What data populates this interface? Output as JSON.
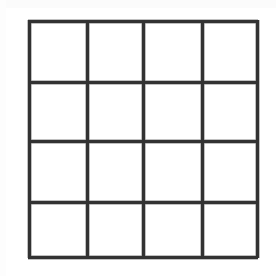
{
  "document": {
    "kind": "scanned-figure",
    "title": "4 by 4 empty grid",
    "background_color": "#ffffff",
    "canvas_width": 276,
    "canvas_height": 276
  },
  "grid": {
    "name": "4x4 grid",
    "rows": 4,
    "columns": 4,
    "cell_count": 16,
    "line_color": "#323232",
    "line_soft_color": "#8d8d8d",
    "cell_fill_color": "#ffffff",
    "line_thickness": 3,
    "bounds": {
      "left": 29,
      "top": 21,
      "right": 257,
      "bottom": 257,
      "width": 228,
      "height": 236
    },
    "vertical_line_x": [
      29,
      87,
      143,
      202,
      257
    ],
    "horizontal_line_y": [
      21,
      82,
      141,
      202,
      257
    ],
    "cells": [
      {
        "row": 1,
        "column": 1,
        "label": ""
      },
      {
        "row": 1,
        "column": 2,
        "label": ""
      },
      {
        "row": 1,
        "column": 3,
        "label": ""
      },
      {
        "row": 1,
        "column": 4,
        "label": ""
      },
      {
        "row": 2,
        "column": 1,
        "label": ""
      },
      {
        "row": 2,
        "column": 2,
        "label": ""
      },
      {
        "row": 2,
        "column": 3,
        "label": ""
      },
      {
        "row": 2,
        "column": 4,
        "label": ""
      },
      {
        "row": 3,
        "column": 1,
        "label": ""
      },
      {
        "row": 3,
        "column": 2,
        "label": ""
      },
      {
        "row": 3,
        "column": 3,
        "label": ""
      },
      {
        "row": 3,
        "column": 4,
        "label": ""
      },
      {
        "row": 4,
        "column": 1,
        "label": ""
      },
      {
        "row": 4,
        "column": 2,
        "label": ""
      },
      {
        "row": 4,
        "column": 3,
        "label": ""
      },
      {
        "row": 4,
        "column": 4,
        "label": ""
      }
    ]
  }
}
